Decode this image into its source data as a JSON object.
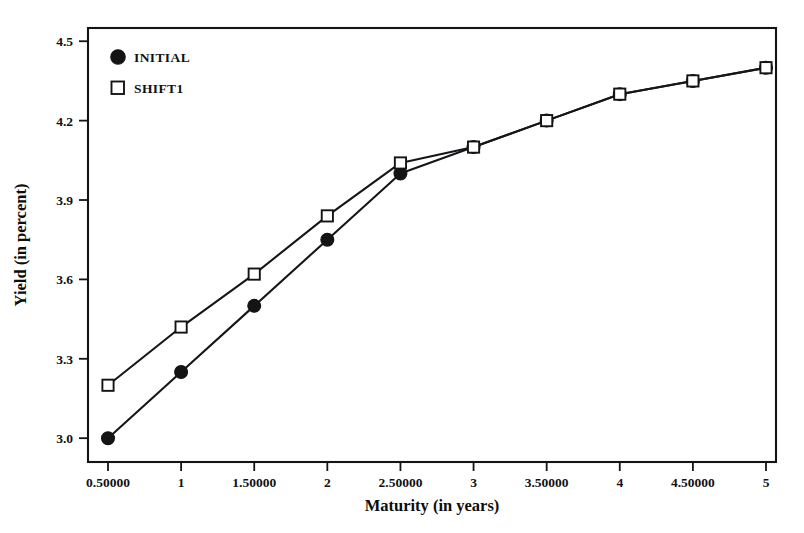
{
  "chart_data": {
    "type": "line",
    "title": "",
    "xlabel": "Maturity (in years)",
    "ylabel": "Yield (in percent)",
    "x": [
      0.5,
      1,
      1.5,
      2,
      2.5,
      3,
      3.5,
      4,
      4.5,
      5
    ],
    "xtick_labels": [
      "0.50000",
      "1",
      "1.50000",
      "2",
      "2.50000",
      "3",
      "3.50000",
      "4",
      "4.50000",
      "5"
    ],
    "ytick_labels": [
      "3.0",
      "3.3",
      "3.6",
      "3.9",
      "4.2",
      "4.5"
    ],
    "ytick_values": [
      3.0,
      3.3,
      3.6,
      3.9,
      4.2,
      4.5
    ],
    "xlim": [
      0.5,
      5.0
    ],
    "ylim": [
      2.91,
      4.55
    ],
    "grid": false,
    "legend_position": "top-left",
    "series": [
      {
        "name": "INITIAL",
        "marker": "filled-circle",
        "color": "#141414",
        "values": [
          3.0,
          3.25,
          3.5,
          3.75,
          4.0,
          4.1,
          4.2,
          4.3,
          4.35,
          4.4
        ]
      },
      {
        "name": "SHIFT1",
        "marker": "open-square",
        "color": "#141414",
        "values": [
          3.2,
          3.42,
          3.62,
          3.84,
          4.04,
          4.1,
          4.2,
          4.3,
          4.35,
          4.4
        ]
      }
    ]
  },
  "legend": {
    "entries": [
      {
        "label": "INITIAL",
        "marker": "filled-circle-icon"
      },
      {
        "label": "SHIFT1",
        "marker": "open-square-icon"
      }
    ]
  },
  "axes": {
    "x_title": "Maturity (in years)",
    "y_title": "Yield (in percent)"
  }
}
